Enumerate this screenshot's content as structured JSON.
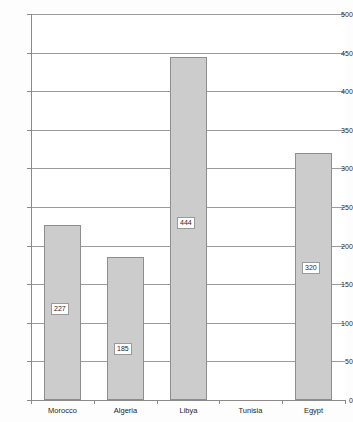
{
  "chart_data": {
    "type": "bar",
    "title": "",
    "subtitle": "",
    "xlabel": "",
    "ylabel": "",
    "categories": [
      "Morocco",
      "Algeria",
      "Libya",
      "Tunisia",
      "Egypt"
    ],
    "values": [
      227,
      185,
      444,
      null,
      320
    ],
    "data_labels": [
      "227",
      "185",
      "444",
      "",
      "320"
    ],
    "ylim": [
      0,
      500
    ],
    "ytick_values": [
      0,
      50,
      100,
      150,
      200,
      250,
      300,
      350,
      400,
      450,
      500
    ],
    "ytick_labels": [
      "0",
      "50",
      "100",
      "150",
      "200",
      "250",
      "300",
      "350",
      "400",
      "450",
      "500"
    ],
    "grid": true,
    "legend": false,
    "legend_position": "none",
    "bar_fill_color": "#cccccc",
    "bar_border_color": "#8e8e8e",
    "gridline_color": "#9b9b9b",
    "axis_color": "#8a8a8a",
    "background_color": "#ffffff"
  }
}
